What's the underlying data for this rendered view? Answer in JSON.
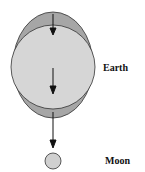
{
  "diagram": {
    "labels": {
      "earth": "Earth",
      "moon": "Moon"
    },
    "colors": {
      "bulge": "#a6a6a6",
      "earth": "#d6d6d6",
      "moon": "#d0d0d0",
      "outline": "#333333",
      "arrow": "#111111"
    }
  }
}
